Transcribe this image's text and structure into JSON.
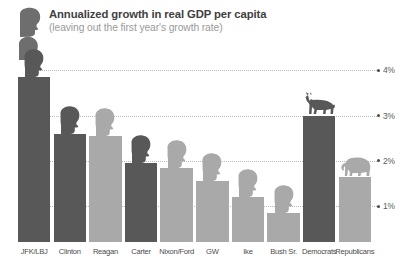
{
  "header": {
    "title": "Annualized growth in real GDP per capita",
    "subtitle": "(leaving out the first year's growth rate)",
    "figure_icon": "presidential-head-silhouette-icon",
    "figure_icon_2": "presidential-head-silhouette-small-icon"
  },
  "colors": {
    "dark_bar": "#585858",
    "light_bar": "#a9a9a9",
    "title_text": "#3f3f3f",
    "subtitle_text": "#9a9a9a",
    "gridline": "#b9b9b9",
    "axis_label": "#5a5a5a",
    "bar_label": "#4b4b4b",
    "background": "#ffffff"
  },
  "chart_data": {
    "type": "bar",
    "title": "Annualized growth in real GDP per capita",
    "subtitle": "(leaving out the first year's growth rate)",
    "xlabel": "",
    "ylabel": "",
    "ylim": [
      0,
      4.3
    ],
    "grid": true,
    "legend_position": "none",
    "yticks": [
      "1%",
      "2%",
      "3%",
      "4%"
    ],
    "ytick_values": [
      1,
      2,
      3,
      4
    ],
    "categories": [
      "JFK/LBJ",
      "Clinton",
      "Reagan",
      "Carter",
      "Nixon/Ford",
      "GW",
      "Ike",
      "Bush Sr.",
      "Democrats",
      "Republicans"
    ],
    "values": [
      3.85,
      2.6,
      2.55,
      1.95,
      1.85,
      1.55,
      1.2,
      0.85,
      3.0,
      1.65
    ],
    "bars": [
      {
        "label": "JFK/LBJ",
        "value": 3.85,
        "party": "democrat",
        "color": "#585858",
        "icon": "head-silhouette-icon"
      },
      {
        "label": "Clinton",
        "value": 2.6,
        "party": "democrat",
        "color": "#585858",
        "icon": "head-silhouette-icon"
      },
      {
        "label": "Reagan",
        "value": 2.55,
        "party": "republican",
        "color": "#a9a9a9",
        "icon": "head-silhouette-icon"
      },
      {
        "label": "Carter",
        "value": 1.95,
        "party": "democrat",
        "color": "#585858",
        "icon": "head-silhouette-icon"
      },
      {
        "label": "Nixon/Ford",
        "value": 1.85,
        "party": "republican",
        "color": "#a9a9a9",
        "icon": "head-silhouette-icon"
      },
      {
        "label": "GW",
        "value": 1.55,
        "party": "republican",
        "color": "#a9a9a9",
        "icon": "head-silhouette-icon"
      },
      {
        "label": "Ike",
        "value": 1.2,
        "party": "republican",
        "color": "#a9a9a9",
        "icon": "head-silhouette-icon"
      },
      {
        "label": "Bush Sr.",
        "value": 0.85,
        "party": "republican",
        "color": "#a9a9a9",
        "icon": "head-silhouette-icon"
      },
      {
        "label": "Democrats",
        "value": 3.0,
        "party": "democrat",
        "color": "#585858",
        "icon": "donkey-icon"
      },
      {
        "label": "Republicans",
        "value": 1.65,
        "party": "republican",
        "color": "#a9a9a9",
        "icon": "elephant-icon"
      }
    ]
  }
}
